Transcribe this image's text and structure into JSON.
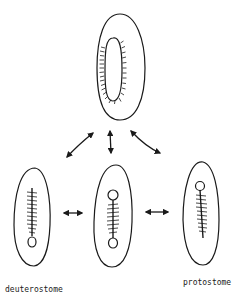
{
  "diagram": {
    "type": "embryo gastrulation / blastopore fate schematic",
    "nodes": [
      {
        "id": "ancestor",
        "description": "elongated embryo with slit-like blastopore lined with cilia",
        "position": "top-center"
      },
      {
        "id": "deuterostome",
        "description": "embryo with gut tube, anus (loop) at bottom",
        "position": "bottom-left",
        "label": "deuterostome"
      },
      {
        "id": "amphistome",
        "description": "embryo with gut tube and openings (loops) at both ends",
        "position": "bottom-center"
      },
      {
        "id": "protostome",
        "description": "embryo with gut tube, mouth (loop) at top",
        "position": "bottom-right",
        "label": "protostome"
      }
    ],
    "edges": [
      {
        "from": "ancestor",
        "to": "deuterostome",
        "style": "double-headed curved arrow"
      },
      {
        "from": "ancestor",
        "to": "amphistome",
        "style": "double-headed straight arrow"
      },
      {
        "from": "ancestor",
        "to": "protostome",
        "style": "double-headed curved arrow"
      },
      {
        "from": "deuterostome",
        "to": "amphistome",
        "style": "double-headed arrow"
      },
      {
        "from": "amphistome",
        "to": "protostome",
        "style": "double-headed arrow"
      }
    ]
  },
  "labels": {
    "deuterostome": "deuterostome",
    "protostome": "protostome"
  },
  "colors": {
    "ink": "#1a1a1a",
    "background": "#ffffff"
  }
}
